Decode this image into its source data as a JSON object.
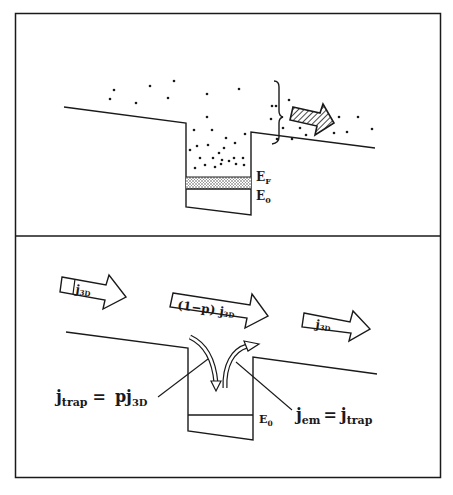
{
  "top_panel": {
    "labels": {
      "fermi_level": "E",
      "fermi_level_sub": "F",
      "ground_level": "E",
      "ground_level_sub": "0"
    },
    "arrow": "hatched-transport-arrow"
  },
  "bottom_panel": {
    "flux_left": {
      "main": "j",
      "sub": "3D"
    },
    "flux_middle": {
      "prefix": "(1−p) ",
      "main": "j",
      "sub": "3D"
    },
    "flux_right": {
      "main": "j",
      "sub": "3D"
    },
    "trap_equation": {
      "lhs_main": "j",
      "lhs_sub": "trap",
      "equals": "=",
      "rhs_coef": "p",
      "rhs_main": "j",
      "rhs_sub": "3D"
    },
    "emission_equation": {
      "lhs_main": "j",
      "lhs_sub": "em",
      "equals": "=",
      "rhs_main": "j",
      "rhs_sub": "trap"
    },
    "ground_level": "E",
    "ground_level_sub": "0"
  }
}
